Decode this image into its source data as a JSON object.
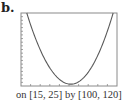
{
  "panel_label": "b.",
  "caption": "on [15, 25] by [100, 120]",
  "colors": {
    "frame": "#8a8a8a",
    "curve": "#5a5a5a",
    "text": "#333333"
  },
  "chart_data": {
    "type": "line",
    "title": "",
    "xlabel": "",
    "ylabel": "",
    "xlim": [
      15,
      25
    ],
    "ylim": [
      100,
      120
    ],
    "x_ticks_count": 10,
    "y_ticks_count": 20,
    "grid": false,
    "legend": null,
    "series": [
      {
        "name": "parabola",
        "shape": "upward-opening parabola",
        "vertex": [
          20.2,
          100.5
        ],
        "x": [
          15.6,
          16,
          17,
          18,
          19,
          20,
          20.2,
          21,
          22,
          23,
          24,
          24.6
        ],
        "y": [
          120,
          117.3,
          110.7,
          105.4,
          101.8,
          100.5,
          100.5,
          101.1,
          103.4,
          107.6,
          113.5,
          120
        ]
      }
    ],
    "annotations": [
      "b.",
      "on [15, 25] by [100, 120]"
    ]
  }
}
